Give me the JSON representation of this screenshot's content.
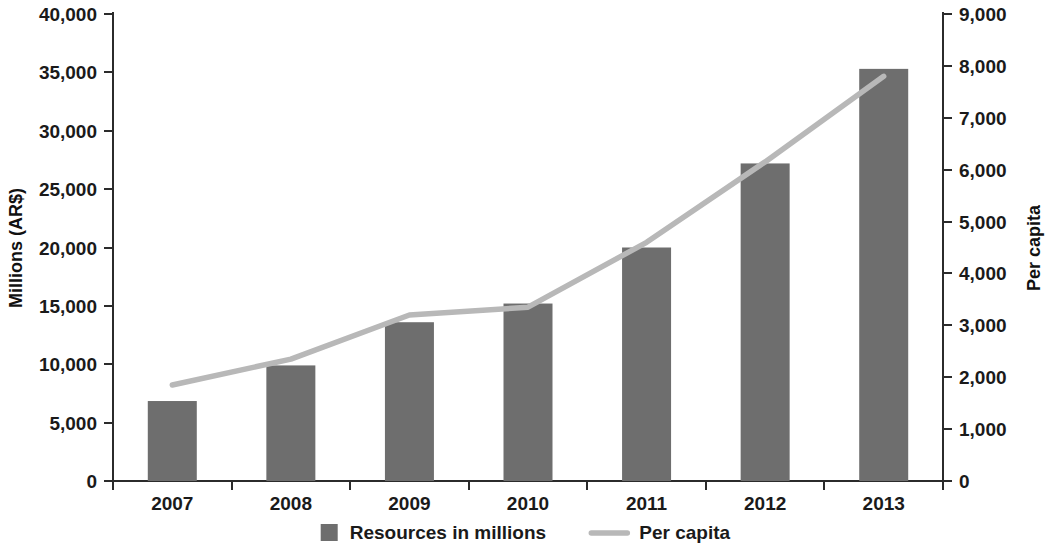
{
  "chart_data": {
    "type": "bar",
    "title": "",
    "subtitle": "",
    "xlabel": "",
    "ylabel": "Millions (AR$)",
    "y2label": "Per capita",
    "categories": [
      "2007",
      "2008",
      "2009",
      "2010",
      "2011",
      "2012",
      "2013"
    ],
    "grid": false,
    "legend_position": "bottom",
    "ylim": [
      0,
      40000
    ],
    "y2lim": [
      0,
      9000
    ],
    "yticks": [
      "0",
      "5,000",
      "10,000",
      "15,000",
      "20,000",
      "25,000",
      "30,000",
      "35,000",
      "40,000"
    ],
    "ytick_values": [
      0,
      5000,
      10000,
      15000,
      20000,
      25000,
      30000,
      35000,
      40000
    ],
    "y2ticks": [
      "0",
      "1,000",
      "2,000",
      "3,000",
      "4,000",
      "5,000",
      "6,000",
      "7,000",
      "8,000",
      "9,000"
    ],
    "y2tick_values": [
      0,
      1000,
      2000,
      3000,
      4000,
      5000,
      6000,
      7000,
      8000,
      9000
    ],
    "series": [
      {
        "name": "Resources in millions",
        "type": "bar",
        "axis": "left",
        "color": "#6e6e6e",
        "values": [
          6850,
          9900,
          13600,
          15200,
          20000,
          27200,
          35300
        ]
      },
      {
        "name": "Per capita",
        "type": "line",
        "axis": "right",
        "color": "#b8b8b8",
        "values": [
          1850,
          2350,
          3200,
          3350,
          4600,
          6150,
          7800
        ]
      }
    ]
  },
  "legend": {
    "items": [
      {
        "label": "Resources in millions",
        "marker": "square",
        "color": "#6e6e6e"
      },
      {
        "label": "Per capita",
        "marker": "line",
        "color": "#b8b8b8"
      }
    ]
  }
}
